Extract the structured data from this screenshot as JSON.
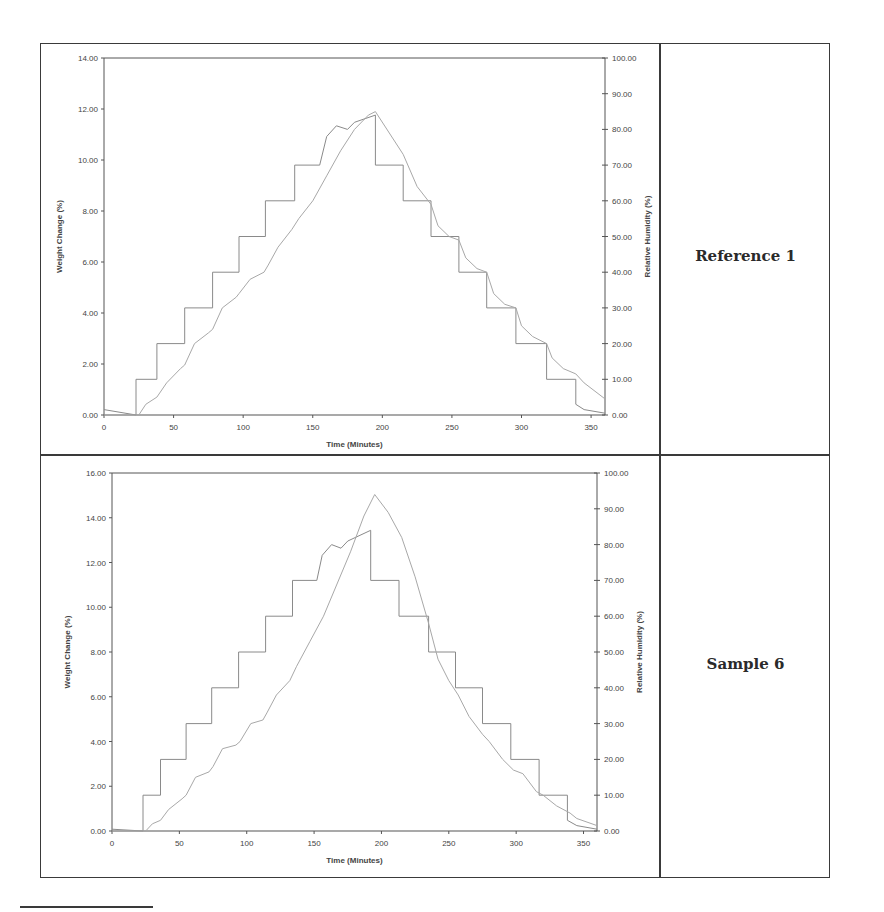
{
  "labels": {
    "top": "Reference 1",
    "bottom": "Sample 6"
  },
  "chart_data": [
    {
      "type": "line",
      "title": "",
      "panel_label": "Reference 1",
      "xlabel": "Time (Minutes)",
      "ylabel": "Weight Change (%)",
      "y2label": "Relative Humidity (%)",
      "xlim": [
        0,
        360
      ],
      "ylim": [
        0,
        14
      ],
      "y2lim": [
        0,
        100
      ],
      "xticks": [
        "0",
        "50",
        "100",
        "150",
        "200",
        "250",
        "300",
        "350"
      ],
      "yticks": [
        "0.00",
        "2.00",
        "4.00",
        "6.00",
        "8.00",
        "10.00",
        "12.00",
        "14.00"
      ],
      "y2ticks": [
        "0.00",
        "10.00",
        "20.00",
        "30.00",
        "40.00",
        "50.00",
        "60.00",
        "70.00",
        "80.00",
        "90.00",
        "100.00"
      ],
      "grid": false,
      "legend": null,
      "series": [
        {
          "name": "Relative Humidity (%)",
          "axis": "right",
          "x": [
            0,
            23,
            23,
            38,
            38,
            58,
            58,
            78,
            78,
            97,
            97,
            116,
            116,
            137,
            137,
            155,
            160,
            167,
            175,
            180,
            195,
            195,
            215,
            215,
            235,
            235,
            255,
            255,
            275,
            275,
            296,
            296,
            318,
            318,
            339,
            339,
            345,
            360
          ],
          "y": [
            1.5,
            0,
            10,
            10,
            20,
            20,
            30,
            30,
            40,
            40,
            50,
            50,
            60,
            60,
            70,
            70,
            78,
            81,
            80,
            82,
            84,
            70,
            70,
            60,
            60,
            50,
            50,
            40,
            40,
            30,
            30,
            20,
            20,
            10,
            10,
            3,
            1.5,
            0.5
          ]
        },
        {
          "name": "Weight Change (%)",
          "axis": "right",
          "x": [
            0,
            25,
            30,
            38,
            45,
            55,
            58,
            65,
            75,
            78,
            85,
            95,
            97,
            105,
            115,
            118,
            125,
            135,
            140,
            150,
            160,
            170,
            180,
            190,
            195,
            205,
            215,
            225,
            235,
            240,
            248,
            255,
            260,
            268,
            275,
            280,
            288,
            296,
            300,
            308,
            318,
            322,
            330,
            339,
            345,
            360
          ],
          "y": [
            0,
            0,
            3,
            5,
            9,
            13,
            14,
            20,
            23,
            24,
            30,
            33,
            34,
            38,
            40,
            42,
            47,
            52,
            55,
            60,
            67,
            74,
            80,
            84,
            85,
            79,
            73,
            64,
            59,
            53,
            50,
            49,
            44,
            41,
            40,
            34,
            31,
            30,
            25,
            22,
            20,
            16,
            13,
            11.5,
            9,
            4.5
          ]
        }
      ]
    },
    {
      "type": "line",
      "title": "",
      "panel_label": "Sample 6",
      "xlabel": "Time (Minutes)",
      "ylabel": "Weight Change (%)",
      "y2label": "Relative Humidity (%)",
      "xlim": [
        0,
        360
      ],
      "ylim": [
        0,
        16
      ],
      "y2lim": [
        0,
        100
      ],
      "xticks": [
        "0",
        "50",
        "100",
        "150",
        "200",
        "250",
        "300",
        "350"
      ],
      "yticks": [
        "0.00",
        "2.00",
        "4.00",
        "6.00",
        "8.00",
        "10.00",
        "12.00",
        "14.00",
        "16.00"
      ],
      "y2ticks": [
        "0.00",
        "10.00",
        "20.00",
        "30.00",
        "40.00",
        "50.00",
        "60.00",
        "70.00",
        "80.00",
        "90.00",
        "100.00"
      ],
      "grid": false,
      "legend": null,
      "series": [
        {
          "name": "Relative Humidity (%)",
          "axis": "right",
          "x": [
            0,
            23,
            23,
            36,
            36,
            55,
            55,
            74,
            74,
            94,
            94,
            114,
            114,
            134,
            134,
            152,
            156,
            163,
            170,
            175,
            192,
            192,
            213,
            213,
            235,
            235,
            255,
            255,
            275,
            275,
            296,
            296,
            317,
            317,
            338,
            338,
            345,
            360
          ],
          "y": [
            0.5,
            0,
            10,
            10,
            20,
            20,
            30,
            30,
            40,
            40,
            50,
            50,
            60,
            60,
            70,
            70,
            77,
            80,
            79,
            81,
            84,
            70,
            70,
            60,
            60,
            50,
            50,
            40,
            40,
            30,
            30,
            20,
            20,
            10,
            10,
            3,
            1.5,
            0.5
          ]
        },
        {
          "name": "Weight Change (%)",
          "axis": "right",
          "x": [
            0,
            25,
            30,
            36,
            42,
            52,
            55,
            62,
            72,
            75,
            82,
            92,
            95,
            103,
            112,
            115,
            122,
            132,
            137,
            147,
            157,
            167,
            177,
            187,
            195,
            205,
            215,
            225,
            235,
            242,
            250,
            257,
            265,
            275,
            280,
            290,
            298,
            305,
            315,
            320,
            330,
            340,
            345,
            360
          ],
          "y": [
            0,
            0,
            2,
            3,
            6,
            9,
            10,
            15,
            16.5,
            18,
            23,
            24,
            25,
            30,
            31,
            33,
            38,
            42,
            46,
            53,
            60,
            69,
            78,
            88,
            94,
            89,
            82,
            71,
            58,
            48,
            42,
            38,
            32,
            27,
            25,
            20,
            17,
            16,
            11,
            10,
            7,
            5,
            3.5,
            1.5
          ]
        }
      ]
    }
  ]
}
